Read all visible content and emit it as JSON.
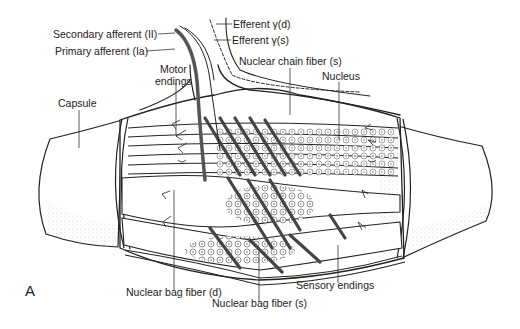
{
  "figure": {
    "panel_letter": "A",
    "colors": {
      "line": "#222222",
      "fiber_fill": "#ffffff",
      "stipple": "#888888",
      "nerve": "#555555"
    }
  },
  "labels": {
    "secondary_afferent": "Secondary afferent (II)",
    "primary_afferent": "Primary afferent (Ia)",
    "efferent_gamma_d": "Efferent γ(d)",
    "efferent_gamma_s": "Efferent γ(s)",
    "motor_endings_1": "Motor",
    "motor_endings_2": "endings",
    "nuclear_chain_fiber": "Nuclear chain fiber (s)",
    "nucleus": "Nucleus",
    "capsule": "Capsule",
    "nuclear_bag_fiber_d": "Nuclear bag fiber (d)",
    "sensory_endings": "Sensory endings",
    "nuclear_bag_fiber_s": "Nuclear bag fiber (s)"
  }
}
